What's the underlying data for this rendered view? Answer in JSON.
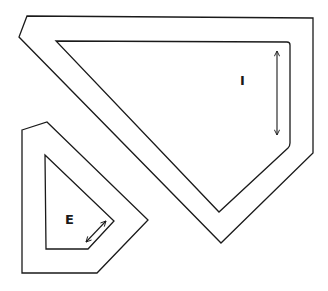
{
  "diagram": {
    "labels": {
      "internal": "I",
      "external": "E"
    },
    "shapes": [
      {
        "name": "large-outer-boundary",
        "points": "27,16 313,18 313,153 221,243 19,37"
      },
      {
        "name": "large-inner-boundary",
        "points": "56,41 290,42 290,145 219,212"
      },
      {
        "name": "small-outer-boundary",
        "points": "22,130 47,122 148,220 97,273 22,273"
      },
      {
        "name": "small-inner-boundary",
        "points": "45,155 114,221 88,249 46,249"
      }
    ],
    "stroke_color": "#1a1a1a",
    "background": "#ffffff"
  }
}
